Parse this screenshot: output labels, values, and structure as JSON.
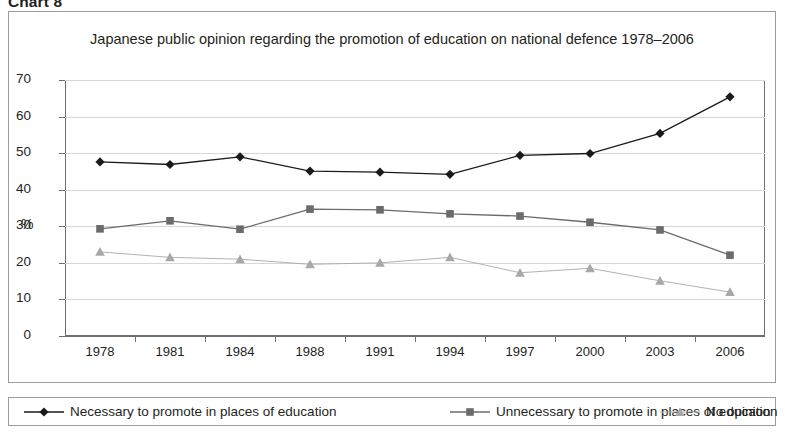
{
  "figure": {
    "caption": "Chart 8",
    "title": "Japanese public opinion regarding the promotion of education on national defence 1978–2006"
  },
  "axes": {
    "y_title": "%",
    "y_ticks": [
      "70",
      "60",
      "50",
      "40",
      "30",
      "20",
      "10",
      "0"
    ],
    "x_ticks": [
      "1978",
      "1981",
      "1984",
      "1988",
      "1991",
      "1994",
      "1997",
      "2000",
      "2003",
      "2006"
    ]
  },
  "legend": {
    "items": [
      {
        "label": "Necessary to promote in places of education",
        "marker": "diamond-marker",
        "color": "#1a1a1a"
      },
      {
        "label": "Unnecessary to promote in places of education",
        "marker": "square-marker",
        "color": "#6b6b6b"
      },
      {
        "label": "No opinion",
        "marker": "triangle-marker",
        "color": "#a8a8a8"
      }
    ]
  },
  "chart_data": {
    "type": "line",
    "title": "Japanese public opinion regarding the promotion of education on national defence 1978–2006",
    "xlabel": "",
    "ylabel": "%",
    "ylim": [
      0,
      70
    ],
    "ytick_step": 10,
    "grid": true,
    "legend_position": "bottom",
    "categories": [
      "1978",
      "1981",
      "1984",
      "1988",
      "1991",
      "1994",
      "1997",
      "2000",
      "2003",
      "2006"
    ],
    "series": [
      {
        "name": "Necessary to promote in places of education",
        "color": "#1a1a1a",
        "marker": "diamond",
        "values": [
          47.6,
          46.9,
          49.0,
          45.1,
          44.8,
          44.2,
          49.4,
          49.9,
          55.4,
          65.4
        ]
      },
      {
        "name": "Unnecessary to promote in places of education",
        "color": "#6b6b6b",
        "marker": "square",
        "values": [
          29.3,
          31.5,
          29.2,
          34.7,
          34.5,
          33.4,
          32.8,
          31.1,
          29.0,
          22.1
        ]
      },
      {
        "name": "No opinion",
        "color": "#a8a8a8",
        "marker": "triangle",
        "values": [
          23.0,
          21.5,
          21.0,
          19.6,
          20.0,
          21.5,
          17.3,
          18.5,
          15.1,
          12.0
        ]
      }
    ]
  }
}
